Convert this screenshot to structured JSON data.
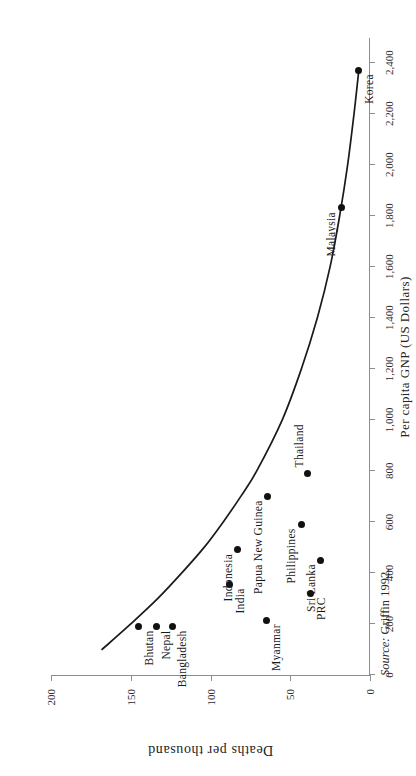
{
  "chart_data": {
    "type": "scatter",
    "title": "",
    "xlabel": "Per capita GNP (US Dollars)",
    "ylabel": "Deaths per thousand",
    "xlim": [
      0,
      2500
    ],
    "ylim": [
      0,
      200
    ],
    "grid": false,
    "legend": "none",
    "xticks": [
      "0",
      "200",
      "400",
      "600",
      "800",
      "1,000",
      "1,200",
      "1,400",
      "1,600",
      "1,800",
      "2,000",
      "2,200",
      "2,400"
    ],
    "xtick_values": [
      0,
      200,
      400,
      600,
      800,
      1000,
      1200,
      1400,
      1600,
      1800,
      2000,
      2200,
      2400
    ],
    "yticks": [
      "0",
      "50",
      "100",
      "150",
      "200"
    ],
    "ytick_values": [
      0,
      50,
      100,
      150,
      200
    ],
    "points": [
      {
        "label": "Bhutan",
        "x": 190,
        "y": 145,
        "label_pos": "below-left"
      },
      {
        "label": "Nepal",
        "x": 190,
        "y": 134,
        "label_pos": "below-left"
      },
      {
        "label": "Bangladesh",
        "x": 190,
        "y": 124,
        "label_pos": "below-left"
      },
      {
        "label": "India",
        "x": 355,
        "y": 88,
        "label_pos": "below-left"
      },
      {
        "label": "Myanmar",
        "x": 215,
        "y": 65,
        "label_pos": "below-left"
      },
      {
        "label": "Indonesia",
        "x": 490,
        "y": 83,
        "label_pos": "above-left"
      },
      {
        "label": "Papua New Guinea",
        "x": 700,
        "y": 64,
        "label_pos": "above-left"
      },
      {
        "label": "PRC",
        "x": 320,
        "y": 37,
        "label_pos": "below-left"
      },
      {
        "label": "Sri Lanka",
        "x": 450,
        "y": 31,
        "label_pos": "above-left"
      },
      {
        "label": "Philippines",
        "x": 590,
        "y": 43,
        "label_pos": "above-left"
      },
      {
        "label": "Thailand",
        "x": 790,
        "y": 39,
        "label_pos": "above-right"
      },
      {
        "label": "Malaysia",
        "x": 1830,
        "y": 18,
        "label_pos": "above-left"
      },
      {
        "label": "Korea",
        "x": 2370,
        "y": 7,
        "label_pos": "below-left"
      }
    ],
    "fit_curve": {
      "name": "fitted trend",
      "description": "smooth declining curve of deaths per thousand against per capita GNP",
      "points": [
        {
          "x": 100,
          "y": 168
        },
        {
          "x": 200,
          "y": 150
        },
        {
          "x": 300,
          "y": 133
        },
        {
          "x": 400,
          "y": 118
        },
        {
          "x": 500,
          "y": 104
        },
        {
          "x": 600,
          "y": 92
        },
        {
          "x": 700,
          "y": 81
        },
        {
          "x": 800,
          "y": 71
        },
        {
          "x": 1000,
          "y": 55
        },
        {
          "x": 1200,
          "y": 43
        },
        {
          "x": 1400,
          "y": 33
        },
        {
          "x": 1600,
          "y": 25
        },
        {
          "x": 1800,
          "y": 19
        },
        {
          "x": 2000,
          "y": 14
        },
        {
          "x": 2200,
          "y": 10
        },
        {
          "x": 2370,
          "y": 7
        }
      ]
    },
    "source_prefix": "Source:",
    "source_text": "Griffin 1992."
  }
}
